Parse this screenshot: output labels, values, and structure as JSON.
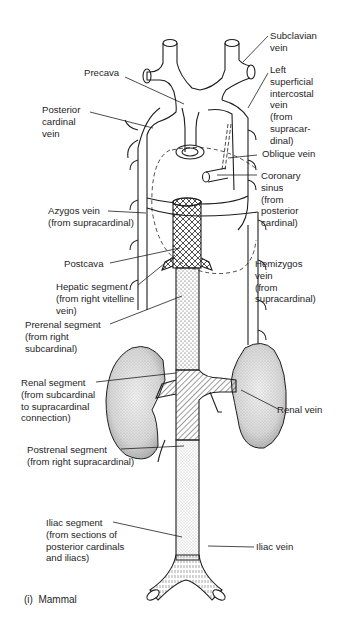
{
  "figure": {
    "caption": "(i)  Mammal"
  },
  "labels": {
    "subclavian_vein": "Subclavian\nvein",
    "precava": "Precava",
    "left_superficial_intercostal_vein": "Left\nsuperficial\nintercostal\nvein\n(from\nsupracar-\ndinal)",
    "posterior_cardinal_vein": "Posterior\ncardinal\nvein",
    "oblique_vein": "Oblique vein",
    "coronary_sinus": "Coronary\nsinus\n(from\nposterior\ncardinal)",
    "azygos_vein": "Azygos vein\n(from supracardinal)",
    "postcava": "Postcava",
    "hemizygos_vein": "Hemizygos\nvein\n(from\nsupracardinal)",
    "hepatic_segment": "Hepatic segment\n(from right vitelline\nvein)",
    "prerenal_segment": "Prerenal segment\n(from right\nsubcardinal)",
    "renal_segment": "Renal segment\n(from subcardinal\nto supracardinal\nconnection)",
    "renal_vein": "Renal vein",
    "postrenal_segment": "Postrenal segment\n(from right supracardinal)",
    "iliac_segment": "Iliac segment\n(from sections of\nposterior cardinals\nand iliacs)",
    "iliac_vein": "Iliac vein"
  },
  "colors": {
    "ink": "#1e1e1e",
    "background": "#ffffff"
  }
}
